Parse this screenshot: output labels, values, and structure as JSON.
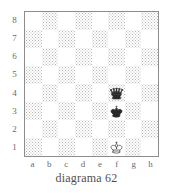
{
  "caption": "diagrama 62",
  "board": {
    "rank_labels": [
      "8",
      "7",
      "6",
      "5",
      "4",
      "3",
      "2",
      "1"
    ],
    "file_labels": [
      "a",
      "b",
      "c",
      "d",
      "e",
      "f",
      "g",
      "h"
    ],
    "light_square_color": "#ffffff",
    "dark_square_color": "#b9b9b9",
    "border_color": "#8d8d8d",
    "label_color": "#6b6b6b",
    "orientation": "white-bottom",
    "pieces": [
      {
        "square": "f4",
        "piece": "queen",
        "color": "black",
        "icon": "black-queen-icon"
      },
      {
        "square": "f3",
        "piece": "king",
        "color": "black",
        "icon": "black-king-icon"
      },
      {
        "square": "f1",
        "piece": "king",
        "color": "white",
        "icon": "white-king-icon"
      }
    ]
  }
}
